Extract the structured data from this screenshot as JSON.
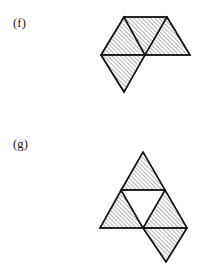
{
  "page": {
    "background_color": "#ffffff",
    "ink_color": "#18181c",
    "width": 214,
    "height": 262,
    "top_bleed_text": "",
    "hatch": {
      "style": "diagonal-line-hatch",
      "angle_deg": 45,
      "direction": "lower-left-to-upper-right",
      "spacing_px": 3,
      "line_color": "#4a4a52"
    }
  },
  "figures": [
    {
      "id": "f",
      "label": "(f)",
      "label_pos": {
        "x": 13,
        "y": 16
      },
      "description": "Polyiamond of four equilateral triangles: a horizontal strip of three triangles (up, down, up) with a fourth downward triangle attached beneath the left triangle.",
      "triangle_count": 4,
      "hatched_count": 4,
      "unhatched_count": 0,
      "origin": {
        "x": 93,
        "y": 8
      },
      "vertices": {
        "top_left_apex": {
          "x": 31,
          "y": 9
        },
        "top_right_apex": {
          "x": 74,
          "y": 9
        },
        "left_point": {
          "x": 8,
          "y": 47
        },
        "center_point": {
          "x": 52,
          "y": 47
        },
        "right_point": {
          "x": 97,
          "y": 47
        },
        "bottom_apex": {
          "x": 31,
          "y": 84
        }
      },
      "triangles": [
        {
          "name": "upper-left-up-triangle",
          "fill": "hatched",
          "points": "8,47 31,9 52,47"
        },
        {
          "name": "upper-middle-down-triangle",
          "fill": "hatched",
          "points": "31,9 74,9 52,47"
        },
        {
          "name": "upper-right-up-triangle",
          "fill": "hatched",
          "points": "52,47 74,9 97,47"
        },
        {
          "name": "lower-left-down-triangle",
          "fill": "hatched",
          "points": "8,47 52,47 31,84"
        }
      ]
    },
    {
      "id": "g",
      "label": "(g)",
      "label_pos": {
        "x": 13,
        "y": 137
      },
      "description": "Sierpinski-style triangle: a large upward triangle subdivided into four, with the three corner triangles hatched and the central inverted triangle left white; a fifth hatched downward triangle hangs below the right corner.",
      "triangle_count": 5,
      "hatched_count": 4,
      "unhatched_count": 1,
      "origin": {
        "x": 90,
        "y": 144
      },
      "vertices": {
        "top_apex": {
          "x": 53,
          "y": 8
        },
        "mid_left": {
          "x": 31,
          "y": 46
        },
        "mid_right": {
          "x": 75,
          "y": 46
        },
        "base_left": {
          "x": 10,
          "y": 84
        },
        "base_center": {
          "x": 53,
          "y": 84
        },
        "base_right": {
          "x": 97,
          "y": 84
        },
        "bottom_apex": {
          "x": 76,
          "y": 118
        }
      },
      "triangles": [
        {
          "name": "top-corner-triangle",
          "fill": "hatched",
          "points": "53,8 31,46 75,46"
        },
        {
          "name": "bottom-left-corner-triangle",
          "fill": "hatched",
          "points": "31,46 10,84 53,84"
        },
        {
          "name": "bottom-right-corner-triangle",
          "fill": "hatched",
          "points": "75,46 53,84 97,84"
        },
        {
          "name": "central-inverted-triangle",
          "fill": "white",
          "points": "31,46 75,46 53,84"
        },
        {
          "name": "hanging-down-triangle",
          "fill": "hatched",
          "points": "53,84 97,84 76,118"
        }
      ]
    }
  ]
}
